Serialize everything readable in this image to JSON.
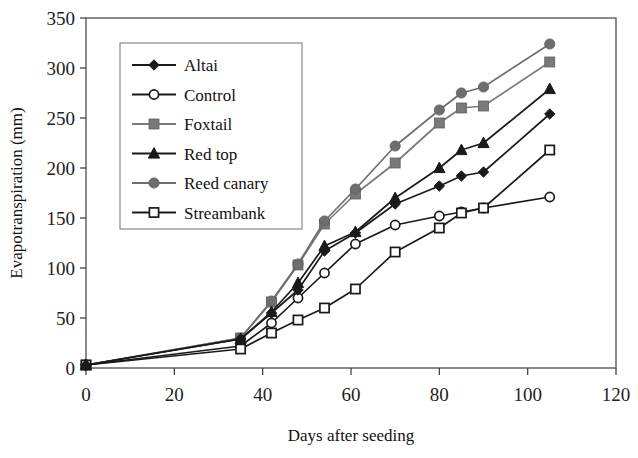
{
  "chart_data": {
    "type": "line",
    "title": "",
    "xlabel": "Days after seeding",
    "ylabel": "Evapotranspiration (mm)",
    "xlim": [
      0,
      120
    ],
    "ylim": [
      0,
      350
    ],
    "xticks": [
      0,
      20,
      40,
      60,
      80,
      100,
      120
    ],
    "yticks": [
      0,
      50,
      100,
      150,
      200,
      250,
      300,
      350
    ],
    "grid": false,
    "legend_position": "upper-left-inside",
    "x": [
      0,
      35,
      42,
      48,
      54,
      61,
      70,
      80,
      85,
      90,
      105
    ],
    "series": [
      {
        "name": "Altai",
        "marker": "filled-diamond",
        "color": "#1a1a1a",
        "values": [
          3,
          29,
          55,
          78,
          117,
          135,
          164,
          182,
          192,
          196,
          254
        ]
      },
      {
        "name": "Control",
        "marker": "open-circle",
        "color": "#1a1a1a",
        "values": [
          3,
          22,
          45,
          70,
          95,
          124,
          143,
          152,
          156,
          160,
          171
        ]
      },
      {
        "name": "Foxtail",
        "marker": "filled-square-gray",
        "color": "#7a7a7a",
        "values": [
          3,
          30,
          66,
          103,
          144,
          174,
          205,
          245,
          260,
          262,
          306
        ]
      },
      {
        "name": "Red top",
        "marker": "filled-triangle",
        "color": "#1a1a1a",
        "values": [
          3,
          29,
          56,
          85,
          122,
          136,
          170,
          200,
          218,
          225,
          279
        ]
      },
      {
        "name": "Reed canary",
        "marker": "filled-circle-gray",
        "color": "#6e6e6e",
        "values": [
          3,
          30,
          67,
          104,
          147,
          179,
          222,
          258,
          275,
          281,
          324
        ]
      },
      {
        "name": "Streambank",
        "marker": "open-square",
        "color": "#1a1a1a",
        "values": [
          3,
          19,
          35,
          48,
          60,
          79,
          116,
          140,
          155,
          160,
          218
        ]
      }
    ]
  },
  "legend": {
    "entries": [
      {
        "label": "Altai"
      },
      {
        "label": "Control"
      },
      {
        "label": "Foxtail"
      },
      {
        "label": "Red top"
      },
      {
        "label": "Reed canary"
      },
      {
        "label": "Streambank"
      }
    ]
  },
  "axes": {
    "y_tick_labels": [
      "0",
      "50",
      "100",
      "150",
      "200",
      "250",
      "300",
      "350"
    ],
    "x_tick_labels": [
      "0",
      "20",
      "40",
      "60",
      "80",
      "100",
      "120"
    ],
    "x_title": "Days after seeding",
    "y_title": "Evapotranspiration (mm)"
  }
}
